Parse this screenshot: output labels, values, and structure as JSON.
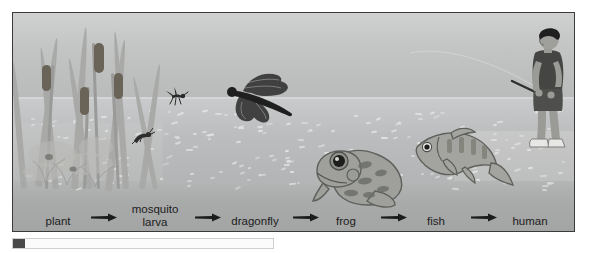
{
  "figure": {
    "alt": "Illustration of a pond food chain from plant to human",
    "scene": {
      "sky_color": "#c6c7c7",
      "water_color": "#bcbdbe",
      "band_color": "#a9aaaa",
      "frame_color": "#3b3b3b",
      "label_color": "#1d1d1d",
      "arrow_color": "#1c1c1c",
      "cattail_head_color": "#6a6358",
      "vegetation_color": "#a8a9a6"
    },
    "organisms": [
      {
        "name": "plant",
        "icon": "cattail-plant-icon"
      },
      {
        "name": "mosquito larva",
        "icon": "mosquito-larva-icon"
      },
      {
        "name": "mosquito",
        "icon": "mosquito-icon"
      },
      {
        "name": "dragonfly",
        "icon": "dragonfly-icon"
      },
      {
        "name": "frog",
        "icon": "frog-icon"
      },
      {
        "name": "fish",
        "icon": "fish-icon"
      },
      {
        "name": "human",
        "icon": "boy-fishing-icon"
      }
    ],
    "chain": {
      "labels": [
        {
          "line1": "plant",
          "line2": ""
        },
        {
          "line1": "mosquito",
          "line2": "larva"
        },
        {
          "line1": "dragonfly",
          "line2": ""
        },
        {
          "line1": "frog",
          "line2": ""
        },
        {
          "line1": "fish",
          "line2": ""
        },
        {
          "line1": "human",
          "line2": ""
        }
      ],
      "arrow_count": 5,
      "arrow_glyph": "right-arrow-icon"
    }
  },
  "caption": {
    "bar_label": "",
    "swatch_label": ""
  }
}
